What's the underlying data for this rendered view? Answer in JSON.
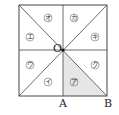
{
  "diagram": {
    "type": "square divided into 8 triangles through center O",
    "points": {
      "O": {
        "label": "O",
        "x": 63,
        "y": 50
      },
      "A": {
        "label": "A",
        "x": 63,
        "y": 96
      },
      "B": {
        "label": "B",
        "x": 107,
        "y": 96
      }
    },
    "square": {
      "x1": 19,
      "y1": 5,
      "x2": 107,
      "y2": 96
    },
    "regions": [
      {
        "id": "a",
        "label": "ア",
        "x": 74,
        "y": 82,
        "shaded": true
      },
      {
        "id": "i",
        "label": "イ",
        "x": 48,
        "y": 82,
        "shaded": false
      },
      {
        "id": "u",
        "label": "ウ",
        "x": 30,
        "y": 65,
        "shaded": false
      },
      {
        "id": "e",
        "label": "エ",
        "x": 30,
        "y": 37,
        "shaded": false
      },
      {
        "id": "o",
        "label": "オ",
        "x": 48,
        "y": 18,
        "shaded": false
      },
      {
        "id": "ka",
        "label": "カ",
        "x": 74,
        "y": 18,
        "shaded": false
      },
      {
        "id": "ki",
        "label": "キ",
        "x": 95,
        "y": 37,
        "shaded": false
      },
      {
        "id": "ku",
        "label": "ク",
        "x": 95,
        "y": 65,
        "shaded": false
      }
    ],
    "colors": {
      "line": "#333333",
      "shade": "#e4e4e4"
    }
  }
}
